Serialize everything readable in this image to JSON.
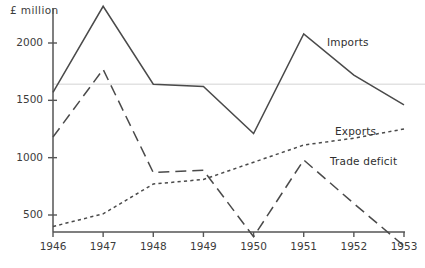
{
  "axis_unit": "£ million",
  "caption": "",
  "labels": {
    "imports": "Imports",
    "exports": "Exports",
    "trade_deficit": "Trade deficit"
  },
  "colors": {
    "ink": "#3a3a3a",
    "line": "#4a4a4a",
    "gridline": "#e2e2e2",
    "axis": "#555555"
  },
  "chart_data": {
    "type": "line",
    "title": "",
    "xlabel": "",
    "ylabel": "£ million",
    "categories": [
      "1946",
      "1947",
      "1948",
      "1949",
      "1950",
      "1951",
      "1952",
      "1953"
    ],
    "x": [
      1946,
      1947,
      1948,
      1949,
      1950,
      1951,
      1952,
      1953
    ],
    "ylim": [
      0,
      2400
    ],
    "yticks": [
      500,
      1000,
      1500,
      2000
    ],
    "ytick_labels": [
      "500",
      "1000",
      "1500",
      "2000"
    ],
    "grid": true,
    "gridlines": [
      1640
    ],
    "legend_position": "inline-right",
    "series": [
      {
        "name": "Imports",
        "style": "solid",
        "values": [
          1570,
          2320,
          1640,
          1620,
          1210,
          2080,
          1720,
          1460
        ]
      },
      {
        "name": "Exports",
        "style": "dotted",
        "values": [
          400,
          510,
          770,
          810,
          960,
          1110,
          1170,
          1250
        ]
      },
      {
        "name": "Trade deficit",
        "style": "dashed",
        "values": [
          1180,
          1770,
          870,
          890,
          310,
          980,
          600,
          230
        ]
      }
    ]
  }
}
